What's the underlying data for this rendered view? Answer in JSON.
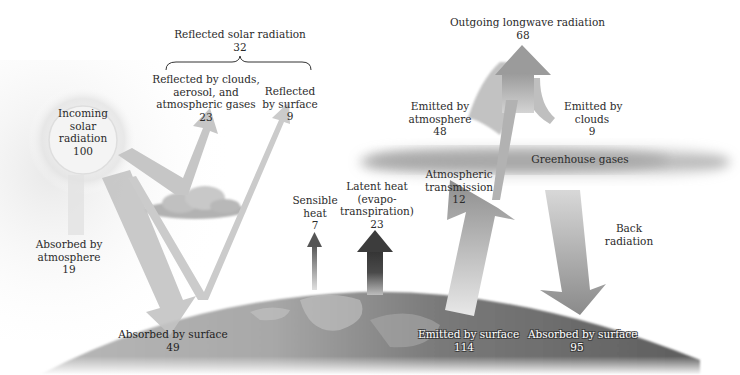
{
  "diagram": {
    "colors": {
      "arrow_light": "#c9c9c9",
      "arrow_mid": "#9a9a9a",
      "arrow_dark": "#555555",
      "earth": "#7a7a7a",
      "earth_light": "#b5b5b5",
      "cloud": "#a8a8a8",
      "sun_glow": "#e8e8e8",
      "text": "#2b2b2b"
    },
    "labels": {
      "reflected_total": {
        "title": "Reflected solar radiation",
        "value": "32"
      },
      "reflected_clouds": {
        "line1": "Reflected by clouds,",
        "line2": "aerosol, and",
        "line3": "atmospheric gases",
        "value": "23"
      },
      "reflected_surface": {
        "line1": "Reflected",
        "line2": "by surface",
        "value": "9"
      },
      "incoming": {
        "line1": "Incoming",
        "line2": "solar",
        "line3": "radiation",
        "value": "100"
      },
      "absorbed_atmosphere": {
        "line1": "Absorbed by",
        "line2": "atmosphere",
        "value": "19"
      },
      "absorbed_surface_solar": {
        "line1": "Absorbed by surface",
        "value": "49"
      },
      "sensible_heat": {
        "line1": "Sensible",
        "line2": "heat",
        "value": "7"
      },
      "latent_heat": {
        "line1": "Latent heat",
        "line2": "(evapo-",
        "line3": "transpiration)",
        "value": "23"
      },
      "outgoing_longwave": {
        "title": "Outgoing longwave radiation",
        "value": "68"
      },
      "emitted_atmosphere": {
        "line1": "Emitted by",
        "line2": "atmosphere",
        "value": "48"
      },
      "emitted_clouds": {
        "line1": "Emitted by",
        "line2": "clouds",
        "value": "9"
      },
      "greenhouse": {
        "line1": "Greenhouse gases"
      },
      "atmospheric_transmission": {
        "line1": "Atmospheric",
        "line2": "transmission",
        "value": "12"
      },
      "back_radiation": {
        "line1": "Back",
        "line2": "radiation"
      },
      "emitted_surface": {
        "line1": "Emitted by surface",
        "value": "114"
      },
      "absorbed_surface_back": {
        "line1": "Absorbed by surface",
        "value": "95"
      }
    }
  }
}
